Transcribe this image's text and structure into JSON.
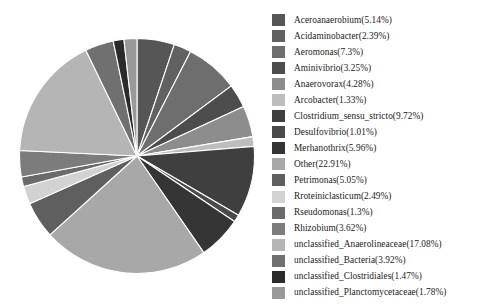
{
  "chart_data": {
    "type": "pie",
    "title": "",
    "legend_position": "right",
    "start_angle_deg": 90,
    "direction": "clockwise",
    "categories": [
      "Aceroanaerobium",
      "Acidaminobacter",
      "Aeromonas",
      "Aminivibrio",
      "Anaerovorax",
      "Arcobacter",
      "Clostridium_sensu_stricto",
      "Desulfovibrio",
      "Merhanothrix",
      "Other",
      "Petrimonas",
      "Rroteiniclasticum",
      "Rseudomonas",
      "Rhizobium",
      "unclassified_Anaerolineaceae",
      "unclassified_Bacteria",
      "unclassified_Clostridiales",
      "unclassified_Planctomycetaceae"
    ],
    "values": [
      5.14,
      2.39,
      7.3,
      3.25,
      4.28,
      1.33,
      9.72,
      1.01,
      5.96,
      22.91,
      5.05,
      2.49,
      1.3,
      3.62,
      17.08,
      3.92,
      1.47,
      1.78
    ],
    "unit": "%",
    "colors": [
      "#565656",
      "#616161",
      "#6e6e6e",
      "#4d4d4d",
      "#8d8d8d",
      "#bdbdbd",
      "#3f3f3f",
      "#4a4a4a",
      "#353535",
      "#a8a8a8",
      "#5f5f5f",
      "#d2d2d2",
      "#6a6a6a",
      "#7c7c7c",
      "#b5b5b5",
      "#707070",
      "#2b2b2b",
      "#999999"
    ],
    "slice_border_color": "#ffffff"
  },
  "legend": {
    "entries": [
      {
        "label": "Aceroanaerobium(5.14%)"
      },
      {
        "label": "Acidaminobacter(2.39%)"
      },
      {
        "label": "Aeromonas(7.3%)"
      },
      {
        "label": "Aminivibrio(3.25%)"
      },
      {
        "label": "Anaerovorax(4.28%)"
      },
      {
        "label": "Arcobacter(1.33%)"
      },
      {
        "label": "Clostridium_sensu_stricto(9.72%)"
      },
      {
        "label": "Desulfovibrio(1.01%)"
      },
      {
        "label": "Merhanothrix(5.96%)"
      },
      {
        "label": "Other(22.91%)"
      },
      {
        "label": "Petrimonas(5.05%)"
      },
      {
        "label": "Rroteiniclasticum(2.49%)"
      },
      {
        "label": "Rseudomonas(1.3%)"
      },
      {
        "label": "Rhizobium(3.62%)"
      },
      {
        "label": "unclassified_Anaerolineaceae(17.08%)"
      },
      {
        "label": "unclassified_Bacteria(3.92%)"
      },
      {
        "label": "unclassified_Clostridiales(1.47%)"
      },
      {
        "label": "unclassified_Planctomycetaceae(1.78%)"
      }
    ]
  }
}
